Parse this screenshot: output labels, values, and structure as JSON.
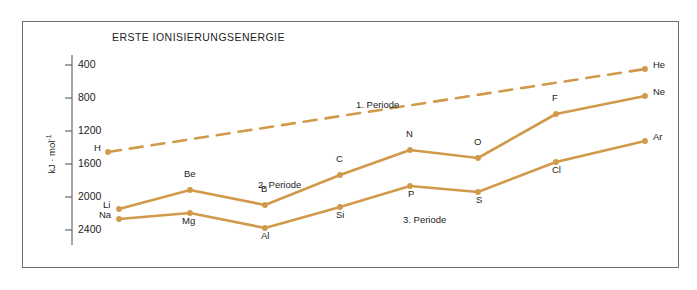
{
  "chart_data": {
    "type": "line",
    "title": "ERSTE IONISIERUNGSENERGIE",
    "xlabel": "",
    "ylabel": "kJ · mol",
    "ylabel_exponent": "-1",
    "ylim": [
      200,
      2600
    ],
    "yticks": [
      400,
      800,
      1200,
      1600,
      2000,
      2400
    ],
    "ytick_labels": [
      "400",
      "800",
      "1200",
      "1600",
      "2000",
      "2400"
    ],
    "grid": false,
    "legend_position": "inline-annotations",
    "annotations": [
      {
        "text": "1. Periode",
        "x_px": 356,
        "y_px": 99
      },
      {
        "text": "2. Periode",
        "x_px": 258,
        "y_px": 179
      },
      {
        "text": "3. Periode",
        "x_px": 403,
        "y_px": 214
      }
    ],
    "series": [
      {
        "name": "1. Periode",
        "style": "dashed",
        "color": "#d19a4a",
        "points": [
          {
            "label": "H",
            "value": 1310,
            "x_px": 108,
            "y_px": 152,
            "label_dx": -14,
            "label_dy": -4
          },
          {
            "label": "He",
            "value": 2370,
            "x_px": 645,
            "y_px": 69,
            "label_dx": 8,
            "label_dy": -4
          }
        ]
      },
      {
        "name": "2. Periode",
        "style": "solid",
        "color": "#d19a4a",
        "points": [
          {
            "label": "Li",
            "value": 520,
            "x_px": 119,
            "y_px": 209,
            "label_dx": -16,
            "label_dy": -4
          },
          {
            "label": "Be",
            "value": 900,
            "x_px": 190,
            "y_px": 190,
            "label_dx": -6,
            "label_dy": -16
          },
          {
            "label": "B",
            "value": 800,
            "x_px": 265,
            "y_px": 205,
            "label_dx": -4,
            "label_dy": -16
          },
          {
            "label": "C",
            "value": 1090,
            "x_px": 340,
            "y_px": 175,
            "label_dx": -4,
            "label_dy": -16
          },
          {
            "label": "N",
            "value": 1400,
            "x_px": 410,
            "y_px": 150,
            "label_dx": -4,
            "label_dy": -16
          },
          {
            "label": "O",
            "value": 1310,
            "x_px": 478,
            "y_px": 158,
            "label_dx": -4,
            "label_dy": -16
          },
          {
            "label": "F",
            "value": 1680,
            "x_px": 556,
            "y_px": 114,
            "label_dx": -4,
            "label_dy": -16
          },
          {
            "label": "Ne",
            "value": 2080,
            "x_px": 645,
            "y_px": 96,
            "label_dx": 8,
            "label_dy": -4
          }
        ]
      },
      {
        "name": "3. Periode",
        "style": "solid",
        "color": "#d19a4a",
        "points": [
          {
            "label": "Na",
            "value": 500,
            "x_px": 119,
            "y_px": 219,
            "label_dx": -20,
            "label_dy": -4
          },
          {
            "label": "Mg",
            "value": 740,
            "x_px": 190,
            "y_px": 213,
            "label_dx": -8,
            "label_dy": 8
          },
          {
            "label": "Al",
            "value": 580,
            "x_px": 265,
            "y_px": 228,
            "label_dx": -4,
            "label_dy": 8
          },
          {
            "label": "Si",
            "value": 790,
            "x_px": 340,
            "y_px": 207,
            "label_dx": -4,
            "label_dy": 8
          },
          {
            "label": "P",
            "value": 1060,
            "x_px": 410,
            "y_px": 186,
            "label_dx": -2,
            "label_dy": 8
          },
          {
            "label": "S",
            "value": 1000,
            "x_px": 478,
            "y_px": 192,
            "label_dx": -2,
            "label_dy": 8
          },
          {
            "label": "Cl",
            "value": 1250,
            "x_px": 556,
            "y_px": 162,
            "label_dx": -4,
            "label_dy": 8
          },
          {
            "label": "Ar",
            "value": 1520,
            "x_px": 645,
            "y_px": 141,
            "label_dx": 8,
            "label_dy": -4
          }
        ]
      }
    ]
  },
  "axis": {
    "tick_positions_px": [
      65,
      98,
      131,
      164,
      197,
      230
    ],
    "axis_x_px": 72,
    "axis_top_px": 55,
    "axis_bottom_px": 245
  },
  "colors": {
    "line": "#d19a4a",
    "frame": "#6e6e6e",
    "axis": "#4a4a4a",
    "text": "#1d1d1d",
    "background": "#ffffff"
  }
}
